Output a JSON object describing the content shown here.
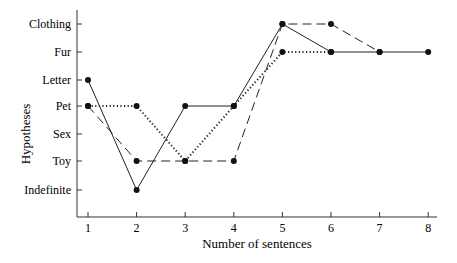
{
  "chart_data": {
    "type": "line",
    "title": "",
    "xlabel": "Number of sentences",
    "ylabel": "Hypotheses",
    "x": [
      1,
      2,
      3,
      4,
      5,
      6,
      7,
      8
    ],
    "x_tick_labels": [
      "1",
      "2",
      "3",
      "4",
      "5",
      "6",
      "7",
      "8"
    ],
    "y_categories": [
      "Indefinite",
      "Toy",
      "Sex",
      "Pet",
      "Letter",
      "Fur",
      "Clothing"
    ],
    "y_tick_labels_top_to_bottom": [
      "Clothing",
      "Fur",
      "Letter",
      "Pet",
      "Sex",
      "Toy",
      "Indefinite"
    ],
    "grid": false,
    "legend": null,
    "series": [
      {
        "name": "solid",
        "style": "solid",
        "x": [
          1,
          2,
          3,
          4,
          5,
          6,
          7,
          8
        ],
        "values": [
          "Letter",
          "Indefinite",
          "Pet",
          "Pet",
          "Clothing",
          "Fur",
          "Fur",
          "Fur"
        ]
      },
      {
        "name": "dashed",
        "style": "dashed",
        "x": [
          1,
          2,
          3,
          4,
          5,
          6,
          7
        ],
        "values": [
          "Pet",
          "Toy",
          "Toy",
          "Toy",
          "Clothing",
          "Clothing",
          "Fur"
        ]
      },
      {
        "name": "dotted",
        "style": "dotted",
        "x": [
          1,
          2,
          3,
          4,
          5,
          6
        ],
        "values": [
          "Pet",
          "Pet",
          "Toy",
          "Pet",
          "Fur",
          "Fur"
        ]
      }
    ]
  }
}
